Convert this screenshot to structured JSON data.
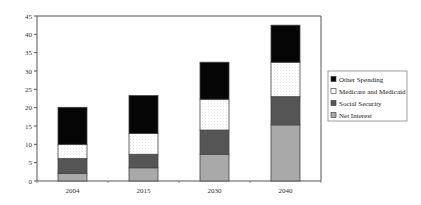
{
  "chart_data": {
    "type": "bar",
    "stacked": true,
    "title": "",
    "xlabel": "",
    "ylabel": "",
    "categories": [
      "2004",
      "2015",
      "2030",
      "2040"
    ],
    "ylim": [
      0,
      45
    ],
    "yticks": [
      0,
      5,
      10,
      15,
      20,
      25,
      30,
      35,
      40,
      45
    ],
    "grid": false,
    "legend_position": "right",
    "series": [
      {
        "name": "Net Interest",
        "color": "#a9a9a9",
        "values": [
          2.1,
          3.6,
          7.3,
          15.3
        ]
      },
      {
        "name": "Social Security",
        "color": "#555555",
        "values": [
          4.0,
          3.7,
          6.6,
          7.7
        ]
      },
      {
        "name": "Medicare and Medicaid",
        "color": "#ffffff",
        "values": [
          3.9,
          5.7,
          8.4,
          9.4
        ]
      },
      {
        "name": "Other Spending",
        "color": "#050505",
        "values": [
          10.1,
          10.3,
          10.1,
          10.1
        ]
      }
    ],
    "legend_order": [
      "Other Spending",
      "Medicare and Medicaid",
      "Social Security",
      "Net Interest"
    ]
  }
}
